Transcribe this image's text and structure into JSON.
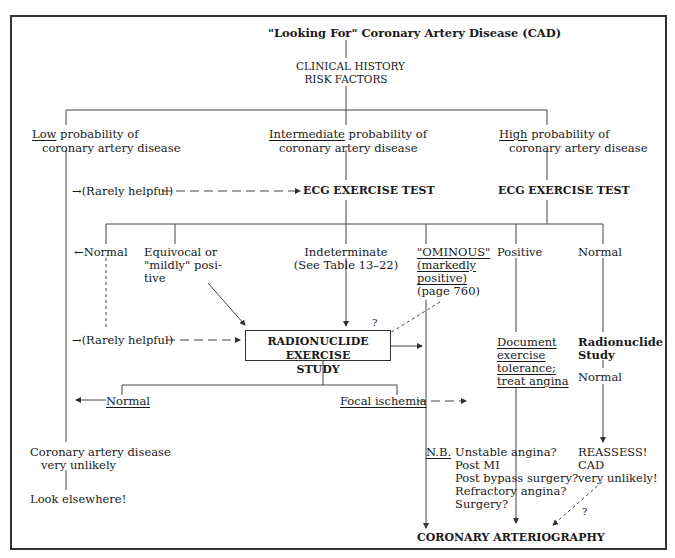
{
  "title": "\"Looking For\" Coronary Artery Disease (CAD)",
  "clinical": {
    "line1": "CLINICAL  HISTORY",
    "line2": "RISK  FACTORS"
  },
  "branches": {
    "low": {
      "key": "Low",
      "rest": " probability of",
      "line2": "coronary artery disease"
    },
    "intermediate": {
      "key": "Intermediate",
      "rest": " probability of",
      "line2": "coronary artery disease"
    },
    "high": {
      "key": "High",
      "rest": " probability of",
      "line2": "coronary artery disease"
    }
  },
  "rarely_helpful_1": "→(Rarely helpful)",
  "ecg_test_mid": "ECG EXERCISE TEST",
  "ecg_test_high": "ECG EXERCISE TEST",
  "results": {
    "normal_left": "←Normal",
    "equivocal": {
      "l1": "Equivocal or",
      "l2": "\"mildly\" posi-",
      "l3": "tive"
    },
    "indeterminate": {
      "l1": "Indeterminate",
      "l2": "(See Table 13–22)"
    },
    "ominous": {
      "l1": "\"OMINOUS\"",
      "l2": "(markedly",
      "l3": "positive)",
      "l4": "(page 760)"
    },
    "positive": "Positive",
    "normal_right": "Normal"
  },
  "rarely_helpful_2": "→(Rarely helpful)",
  "radionuclide_box": {
    "l1": "RADIONUCLIDE EXERCISE",
    "l2": "STUDY"
  },
  "question_mark": "?",
  "document": {
    "l1": "Document",
    "l2": "exercise",
    "l3": "tolerance;",
    "l4": "treat angina"
  },
  "radionuclide_study": {
    "l1": "Radionuclide",
    "l2": "Study",
    "normal": "Normal"
  },
  "radio_results": {
    "normal": "Normal",
    "focal": "Focal ischemia"
  },
  "low_outcome": {
    "l1": "Coronary artery disease",
    "l2": "very unlikely",
    "l3": "Look elsewhere!"
  },
  "nb": {
    "label": "N.B.",
    "items": [
      "Unstable angina?",
      "Post MI",
      "Post bypass surgery?",
      "Refractory angina?",
      "Surgery?"
    ]
  },
  "reassess": {
    "l1": "REASSESS!",
    "l2": "CAD",
    "l3": "very unlikely!"
  },
  "final": "CORONARY ARTERIOGRAPHY"
}
